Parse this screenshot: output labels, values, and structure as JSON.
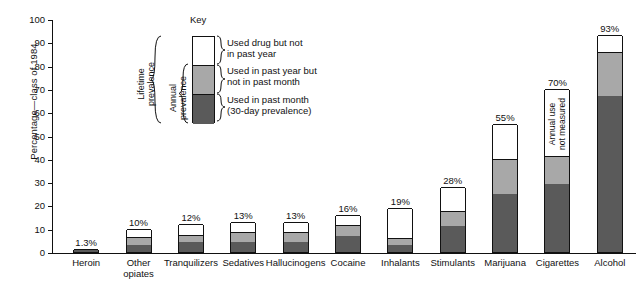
{
  "chart_data": {
    "type": "bar",
    "subtype": "stacked-bar",
    "title": "",
    "xlabel": "",
    "ylabel": "Percentage—class of 1984",
    "ylim": [
      0,
      100
    ],
    "yticks": [
      0,
      10,
      20,
      30,
      40,
      50,
      60,
      70,
      80,
      90,
      100
    ],
    "grid": false,
    "legend_position": "inside-upper-left",
    "categories": [
      "Heroin",
      "Other opiates",
      "Tranquilizers",
      "Sedatives",
      "Hallucinogens",
      "Cocaine",
      "Inhalants",
      "Stimulants",
      "Marijuana",
      "Cigarettes",
      "Alcohol"
    ],
    "series": [
      {
        "name": "Used in past month (30-day prevalence)",
        "color": "#5a5a5a",
        "values": [
          0.8,
          3.2,
          4.2,
          4.5,
          4.5,
          7.0,
          3.0,
          11.0,
          25.0,
          29.0,
          67.0
        ]
      },
      {
        "name": "Used in past year but not in past month",
        "color": "#a8a8a8",
        "values": [
          0.5,
          3.3,
          3.3,
          4.0,
          4.0,
          4.5,
          3.0,
          6.5,
          15.0,
          12.0,
          19.0
        ]
      },
      {
        "name": "Used drug but not in past year",
        "color": "#ffffff",
        "values": [
          0.0,
          3.5,
          4.5,
          4.5,
          4.5,
          4.5,
          13.0,
          10.5,
          15.0,
          29.0,
          7.0
        ]
      }
    ],
    "totals": [
      1.3,
      10,
      12,
      13,
      13,
      16,
      19,
      28,
      55,
      70,
      93
    ],
    "data_labels": [
      "1.3%",
      "10%",
      "12%",
      "13%",
      "13%",
      "16%",
      "19%",
      "28%",
      "55%",
      "70%",
      "93%"
    ],
    "annotations": [
      {
        "category": "Cigarettes",
        "text": "Annual use not measured",
        "orientation": "vertical"
      }
    ]
  },
  "axis": {
    "y_title": "Percentage—class of 1984",
    "y_labels": [
      "100",
      "90",
      "80",
      "70",
      "60",
      "50",
      "40",
      "30",
      "20",
      "10",
      "0"
    ]
  },
  "key": {
    "title": "Key",
    "entries": [
      {
        "swatch": "white",
        "line1": "Used drug but not",
        "line2": "in past year"
      },
      {
        "swatch": "gray",
        "line1": "Used in past year but",
        "line2": "not in past month"
      },
      {
        "swatch": "dark",
        "line1": "Used in past month",
        "line2": "(30-day prevalence)"
      }
    ],
    "bracket_labels": [
      {
        "line1": "Lifetime",
        "line2": "prevalence"
      },
      {
        "line1": "Annual",
        "line2": "prevalence"
      }
    ]
  },
  "categories_display": [
    {
      "l1": "Heroin",
      "l2": ""
    },
    {
      "l1": "Other",
      "l2": "opiates"
    },
    {
      "l1": "Tranquilizers",
      "l2": ""
    },
    {
      "l1": "Sedatives",
      "l2": ""
    },
    {
      "l1": "Hallucinogens",
      "l2": ""
    },
    {
      "l1": "Cocaine",
      "l2": ""
    },
    {
      "l1": "Inhalants",
      "l2": ""
    },
    {
      "l1": "Stimulants",
      "l2": ""
    },
    {
      "l1": "Marijuana",
      "l2": ""
    },
    {
      "l1": "Cigarettes",
      "l2": ""
    },
    {
      "l1": "Alcohol",
      "l2": ""
    }
  ],
  "cigarettes_note": {
    "line1": "Annual use",
    "line2": "not measured"
  },
  "colors": {
    "past_month": "#5a5a5a",
    "past_year_not_month": "#a8a8a8",
    "lifetime_not_year": "#ffffff",
    "outline": "#111111"
  }
}
